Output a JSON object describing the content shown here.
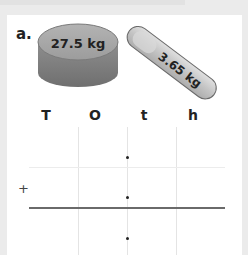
{
  "question": {
    "label": "a.",
    "items": [
      {
        "name": "tub",
        "weight": "27.5 kg"
      },
      {
        "name": "tube",
        "weight": "3.65 kg"
      }
    ]
  },
  "place_value_headers": [
    "T",
    "O",
    "t",
    "h"
  ],
  "working": {
    "operator": "+",
    "decimal_points": 3
  },
  "colors": {
    "background": "#ebebeb",
    "card": "#ffffff",
    "object_gray": "#9a9a9a",
    "text": "#222222"
  }
}
